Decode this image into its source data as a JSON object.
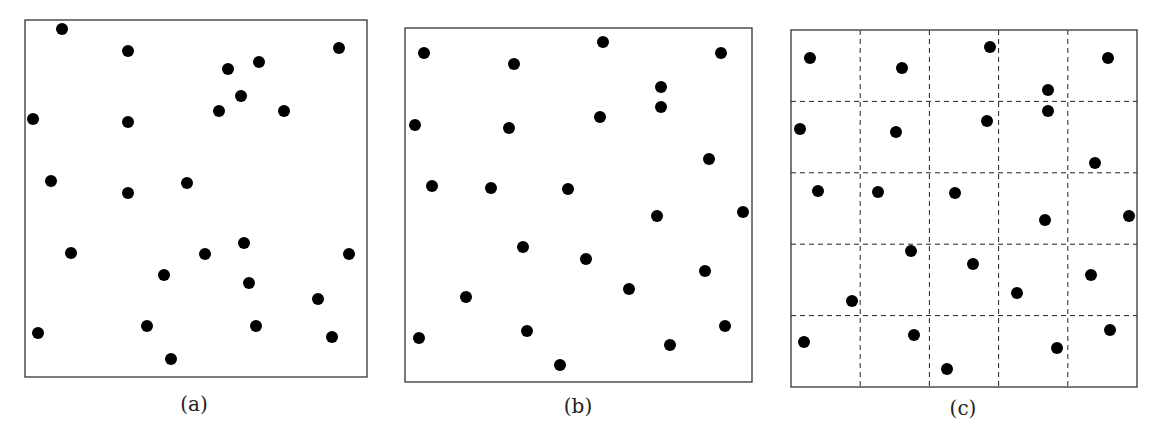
{
  "figure": {
    "dot_color": "#000000",
    "border_color": "#333333",
    "grid_color": "#222222",
    "panels": [
      {
        "id": "a",
        "caption": "(a)",
        "description": "random point pattern",
        "frame": {
          "x": 25,
          "y": 20,
          "w": 342,
          "h": 357
        },
        "grid": null,
        "points": [
          [
            62,
            29
          ],
          [
            128,
            51
          ],
          [
            339,
            48
          ],
          [
            228,
            69
          ],
          [
            259,
            62
          ],
          [
            241,
            96
          ],
          [
            219,
            111
          ],
          [
            284,
            111
          ],
          [
            33,
            119
          ],
          [
            128,
            122
          ],
          [
            51,
            181
          ],
          [
            187,
            183
          ],
          [
            128,
            193
          ],
          [
            71,
            253
          ],
          [
            205,
            254
          ],
          [
            244,
            243
          ],
          [
            349,
            254
          ],
          [
            164,
            275
          ],
          [
            249,
            283
          ],
          [
            318,
            299
          ],
          [
            38,
            333
          ],
          [
            147,
            326
          ],
          [
            256,
            326
          ],
          [
            332,
            337
          ],
          [
            171,
            359
          ]
        ]
      },
      {
        "id": "b",
        "caption": "(b)",
        "description": "regular / inhibited point pattern",
        "frame": {
          "x": 405,
          "y": 28,
          "w": 347,
          "h": 354
        },
        "grid": null,
        "points": [
          [
            424,
            53
          ],
          [
            514,
            64
          ],
          [
            603,
            42
          ],
          [
            721,
            53
          ],
          [
            661,
            87
          ],
          [
            661,
            107
          ],
          [
            600,
            117
          ],
          [
            509,
            128
          ],
          [
            415,
            125
          ],
          [
            709,
            159
          ],
          [
            432,
            186
          ],
          [
            491,
            188
          ],
          [
            568,
            189
          ],
          [
            657,
            216
          ],
          [
            743,
            212
          ],
          [
            523,
            247
          ],
          [
            586,
            259
          ],
          [
            705,
            271
          ],
          [
            466,
            297
          ],
          [
            629,
            289
          ],
          [
            419,
            338
          ],
          [
            527,
            331
          ],
          [
            670,
            345
          ],
          [
            725,
            326
          ],
          [
            560,
            365
          ]
        ]
      },
      {
        "id": "c",
        "caption": "(c)",
        "description": "regular pattern with 5x5 quadrat grid",
        "frame": {
          "x": 791,
          "y": 30,
          "w": 346,
          "h": 357
        },
        "grid": {
          "rows": 5,
          "cols": 5,
          "style": "dashed"
        },
        "points": [
          [
            810,
            58
          ],
          [
            902,
            68
          ],
          [
            990,
            47
          ],
          [
            1108,
            58
          ],
          [
            1048,
            90
          ],
          [
            1048,
            111
          ],
          [
            987,
            121
          ],
          [
            896,
            132
          ],
          [
            800,
            129
          ],
          [
            1095,
            163
          ],
          [
            818,
            191
          ],
          [
            878,
            192
          ],
          [
            955,
            193
          ],
          [
            1045,
            220
          ],
          [
            1129,
            216
          ],
          [
            911,
            251
          ],
          [
            973,
            264
          ],
          [
            1091,
            275
          ],
          [
            852,
            301
          ],
          [
            1017,
            293
          ],
          [
            804,
            342
          ],
          [
            914,
            335
          ],
          [
            1057,
            348
          ],
          [
            1110,
            330
          ],
          [
            947,
            369
          ]
        ]
      }
    ]
  }
}
